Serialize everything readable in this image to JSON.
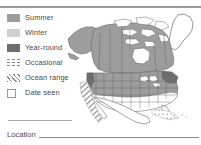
{
  "legend": {
    "items": [
      {
        "label": "Summer",
        "swatch": "summer-swatch",
        "kind": "solid-medium-gray"
      },
      {
        "label": "Winter",
        "swatch": "winter-swatch",
        "kind": "solid-light-gray"
      },
      {
        "label": "Year-round",
        "swatch": "year-round-swatch",
        "kind": "solid-dark-gray"
      },
      {
        "label": "Occasional",
        "swatch": "occasional-swatch",
        "kind": "dotted-pattern"
      },
      {
        "label": "Ocean range",
        "swatch": "ocean-range-swatch",
        "kind": "diagonal-hatch"
      },
      {
        "label": "Date seen",
        "swatch": "date-seen-checkbox",
        "kind": "empty-checkbox"
      }
    ]
  },
  "form": {
    "location_label": "Location",
    "location_value": ""
  },
  "map": {
    "title": "North America range map",
    "regions": [
      "Alaska",
      "Canada",
      "Greenland",
      "United States",
      "Mexico"
    ]
  },
  "colors": {
    "summer": "#9d9d9d",
    "winter": "#cfcfcf",
    "year_round": "#6e6e6e",
    "pattern_gray": "#8a8a8a",
    "rule": "#9a9a9a",
    "text": "#4a4a4a",
    "map_outline": "#6a6a6a",
    "paper": "#ffffff"
  }
}
